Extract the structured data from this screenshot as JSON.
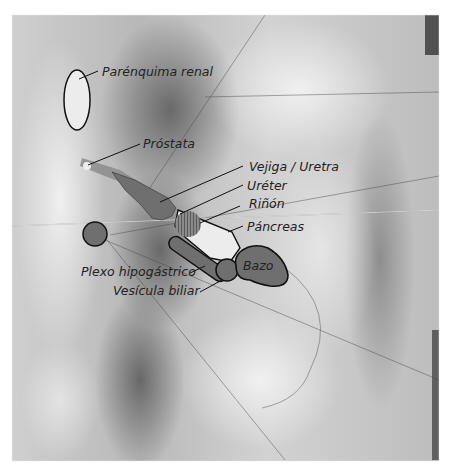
{
  "figure": {
    "colors": {
      "zone_fill_dark": "#6f6f6f",
      "zone_fill_light": "#ececec",
      "zone_stroke": "#111111",
      "label_text": "#222222",
      "leader_line": "#111111"
    },
    "labels": {
      "parenquima_renal": "Parénquima renal",
      "prostata": "Próstata",
      "vejiga_uretra": "Vejiga / Uretra",
      "ureter": "Uréter",
      "rinon": "Riñón",
      "pancreas": "Páncreas",
      "bazo": "Bazo",
      "plexo_hipogastrico": "Plexo hipogástrico",
      "vesicula_biliar": "Vesícula biliar"
    }
  }
}
